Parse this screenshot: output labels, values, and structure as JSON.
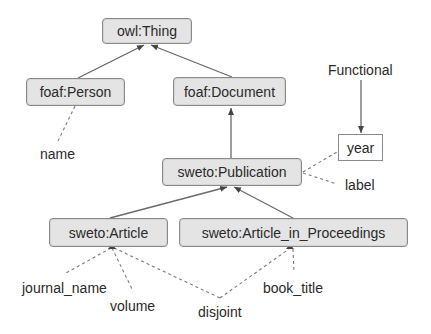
{
  "diagram": {
    "nodes": {
      "owl_thing": "owl:Thing",
      "foaf_person": "foaf:Person",
      "foaf_document": "foaf:Document",
      "sweto_publication": "sweto:Publication",
      "sweto_article": "sweto:Article",
      "sweto_article_in_proceedings": "sweto:Article_in_Proceedings",
      "year": "year"
    },
    "labels": {
      "functional": "Functional",
      "name": "name",
      "label": "label",
      "journal_name": "journal_name",
      "volume": "volume",
      "disjoint": "disjoint",
      "book_title": "book_title"
    },
    "edges": [
      {
        "from": "foaf:Person",
        "to": "owl:Thing",
        "style": "solid-arrow"
      },
      {
        "from": "foaf:Document",
        "to": "owl:Thing",
        "style": "solid-arrow"
      },
      {
        "from": "sweto:Publication",
        "to": "foaf:Document",
        "style": "solid-arrow"
      },
      {
        "from": "sweto:Article",
        "to": "sweto:Publication",
        "style": "solid-arrow"
      },
      {
        "from": "sweto:Article_in_Proceedings",
        "to": "sweto:Publication",
        "style": "solid-arrow"
      },
      {
        "from": "Functional",
        "to": "year",
        "style": "solid-arrow"
      },
      {
        "from": "foaf:Person",
        "to": "name",
        "style": "dashed"
      },
      {
        "from": "sweto:Publication",
        "to": "year",
        "style": "dashed"
      },
      {
        "from": "sweto:Publication",
        "to": "label",
        "style": "dashed"
      },
      {
        "from": "sweto:Article",
        "to": "journal_name",
        "style": "dashed"
      },
      {
        "from": "sweto:Article",
        "to": "volume",
        "style": "dashed"
      },
      {
        "from": "sweto:Article",
        "to": "disjoint",
        "style": "dashed"
      },
      {
        "from": "sweto:Article_in_Proceedings",
        "to": "disjoint",
        "style": "dashed"
      },
      {
        "from": "sweto:Article_in_Proceedings",
        "to": "book_title",
        "style": "dashed"
      }
    ],
    "colors": {
      "node_fill": "#e4e4e4",
      "node_border": "#8a8a8a",
      "edge": "#6a6a6a",
      "text": "#2a2a2a"
    }
  }
}
